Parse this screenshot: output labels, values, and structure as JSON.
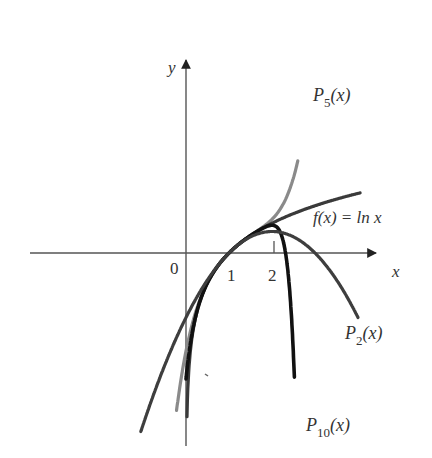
{
  "chart_data": {
    "type": "line",
    "title": "",
    "xlabel": "x",
    "ylabel": "y",
    "origin_label": "0",
    "x_ticks": [
      {
        "value": 1,
        "label": "1"
      },
      {
        "value": 2,
        "label": "2"
      }
    ],
    "grid": false,
    "legend": "inline curve labels",
    "xlim": [
      -1.3,
      4.5
    ],
    "ylim": [
      -4.3,
      4.3
    ],
    "series": [
      {
        "name": "f(x) = ln x",
        "label": "f(x) = ln x",
        "kind": "ln",
        "domain": [
          0.002,
          4.05
        ],
        "color": "#3a3a3a",
        "width": 3.2
      },
      {
        "name": "P_2(x)",
        "label_main": "P",
        "label_sub": "2",
        "label_tail": "(x)",
        "kind": "taylor_ln_at_1",
        "degree": 2,
        "domain": [
          -1.05,
          4.0
        ],
        "color": "#3e3e3e",
        "width": 3.2
      },
      {
        "name": "P_5(x)",
        "label_main": "P",
        "label_sub": "5",
        "label_tail": "(x)",
        "kind": "taylor_ln_at_1",
        "degree": 5,
        "domain": [
          -0.22,
          2.6
        ],
        "color": "#8a8a8a",
        "width": 3.2
      },
      {
        "name": "P_10(x)",
        "label_main": "P",
        "label_sub": "10",
        "label_tail": "(x)",
        "kind": "taylor_ln_at_1",
        "degree": 10,
        "domain": [
          0.0,
          2.52
        ],
        "color": "#111111",
        "width": 3.6
      }
    ],
    "note": "Taylor polynomials of ln x centered at x = 1 compared with f(x) = ln x"
  },
  "layout": {
    "origin_px": [
      186,
      253
    ],
    "unit_px": 43
  }
}
